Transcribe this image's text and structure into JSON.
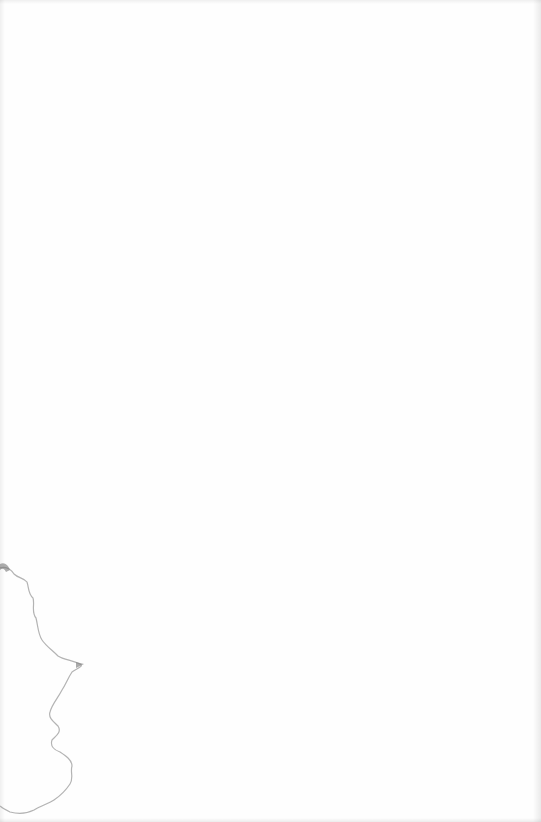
{
  "page": {
    "background_color": "#fefefe",
    "content_text": "",
    "markings": {
      "tear_line_color": "#8a8a8a",
      "edge_shadow_color": "#d8d8d8"
    }
  }
}
